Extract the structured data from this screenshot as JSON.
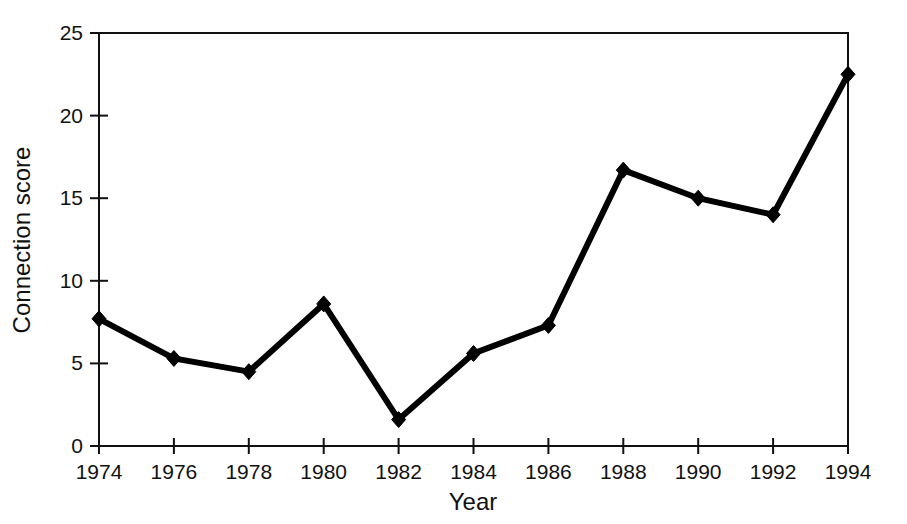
{
  "chart_data": {
    "type": "line",
    "title": "",
    "xlabel": "Year",
    "ylabel": "Connection score",
    "x": [
      1974,
      1976,
      1978,
      1980,
      1982,
      1984,
      1986,
      1988,
      1990,
      1992,
      1994
    ],
    "values": [
      7.7,
      5.3,
      4.5,
      8.6,
      1.6,
      5.6,
      7.3,
      16.7,
      15.0,
      14.0,
      22.5
    ],
    "series": [
      {
        "name": "Connection score",
        "values": [
          7.7,
          5.3,
          4.5,
          8.6,
          1.6,
          5.6,
          7.3,
          16.7,
          15.0,
          14.0,
          22.5
        ]
      }
    ],
    "xlim": [
      1974,
      1994
    ],
    "ylim": [
      0,
      25
    ],
    "xticks": [
      1974,
      1976,
      1978,
      1980,
      1982,
      1984,
      1986,
      1988,
      1990,
      1992,
      1994
    ],
    "xtick_labels": [
      "1974",
      "1976",
      "1978",
      "1980",
      "1982",
      "1984",
      "1986",
      "1988",
      "1990",
      "1992",
      "1994"
    ],
    "yticks": [
      0,
      5,
      10,
      15,
      20,
      25
    ],
    "ytick_labels": [
      "0",
      "5",
      "10",
      "15",
      "20",
      "25"
    ],
    "grid": false,
    "legend": false,
    "legend_position": "none",
    "marker": "diamond",
    "line_color": "#000000",
    "marker_color": "#000000",
    "background_color": "#ffffff",
    "frame": "box"
  },
  "axes": {
    "x_title": "Year",
    "y_title": "Connection score"
  }
}
